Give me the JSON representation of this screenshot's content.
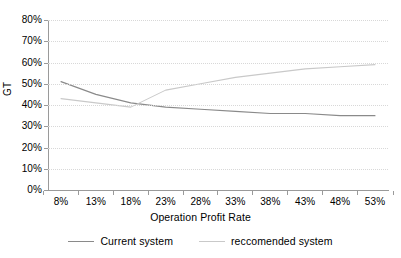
{
  "chart_data": {
    "type": "line",
    "title": "",
    "xlabel": "Operation Profit Rate",
    "ylabel": "GT",
    "categories": [
      "8%",
      "13%",
      "18%",
      "23%",
      "28%",
      "33%",
      "38%",
      "43%",
      "48%",
      "53%"
    ],
    "x": [
      8,
      13,
      18,
      23,
      28,
      33,
      38,
      43,
      48,
      53
    ],
    "ylim": [
      0,
      80
    ],
    "xlim": [
      8,
      53
    ],
    "yticks": [
      "0%",
      "10%",
      "20%",
      "30%",
      "40%",
      "50%",
      "60%",
      "70%",
      "80%"
    ],
    "ytick_values": [
      0,
      10,
      20,
      30,
      40,
      50,
      60,
      70,
      80
    ],
    "grid": "horizontal-dotted",
    "legend_position": "bottom",
    "series": [
      {
        "name": "Current system",
        "color": "#8a8a8a",
        "values": [
          51,
          45,
          41,
          39,
          38,
          37,
          36,
          36,
          35,
          35
        ]
      },
      {
        "name": "reccomended system",
        "color": "#c9c9c9",
        "values": [
          43,
          41,
          39,
          47,
          50,
          53,
          55,
          57,
          58,
          59
        ]
      }
    ]
  },
  "legend": {
    "items": [
      {
        "label": "Current system",
        "color": "#8a8a8a"
      },
      {
        "label": "reccomended system",
        "color": "#c9c9c9"
      }
    ]
  }
}
